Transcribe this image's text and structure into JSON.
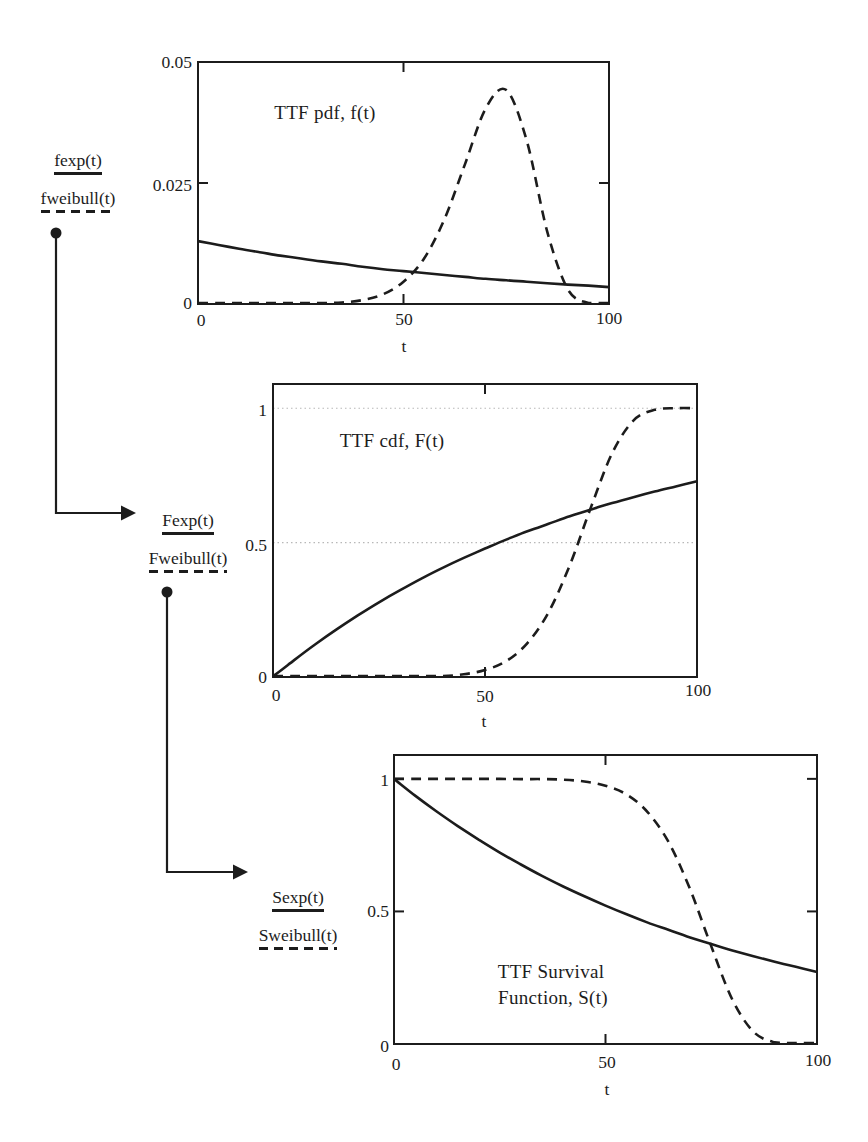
{
  "figure": {
    "background": "#ffffff",
    "ink_color": "#1c1c1c",
    "grid_color": "#b8b8b8"
  },
  "chart_data": [
    {
      "id": "ttf-pdf",
      "type": "line",
      "title": "TTF pdf, f(t)",
      "xlabel": "t",
      "xlim": [
        0,
        100
      ],
      "ylim": [
        0,
        0.05
      ],
      "grid": false,
      "x_tick_labels": [
        "0",
        "50",
        "100"
      ],
      "y_tick_labels": [
        "0",
        "0.025",
        "0.05"
      ],
      "legend": {
        "position": "left",
        "items": [
          {
            "label": "fexp(t)",
            "style": "solid"
          },
          {
            "label": "fweibull(t)",
            "style": "dashed"
          }
        ]
      },
      "x": [
        0,
        5,
        10,
        15,
        20,
        25,
        30,
        35,
        40,
        45,
        50,
        55,
        60,
        65,
        70,
        75,
        80,
        85,
        90,
        95,
        100
      ],
      "series": [
        {
          "name": "fexp(t)",
          "style": "solid",
          "values": [
            0.013,
            0.0122,
            0.0114,
            0.0107,
            0.01,
            0.0094,
            0.0088,
            0.0083,
            0.0077,
            0.0072,
            0.0068,
            0.0064,
            0.006,
            0.0056,
            0.0052,
            0.0049,
            0.0046,
            0.0043,
            0.004,
            0.0038,
            0.0035
          ]
        },
        {
          "name": "fweibull(t)",
          "style": "dashed",
          "values": [
            0,
            0,
            0,
            0,
            0,
            3e-05,
            0.0001,
            0.0003,
            0.0008,
            0.002,
            0.0046,
            0.0094,
            0.0176,
            0.029,
            0.0404,
            0.0442,
            0.0337,
            0.0149,
            0.003,
            0.0002,
            0
          ]
        }
      ]
    },
    {
      "id": "ttf-cdf",
      "type": "line",
      "title": "TTF cdf, F(t)",
      "xlabel": "t",
      "xlim": [
        0,
        100
      ],
      "ylim": [
        0,
        1.09
      ],
      "grid": true,
      "gridlines_at": [
        0.5,
        1
      ],
      "x_tick_labels": [
        "0",
        "50",
        "100"
      ],
      "y_tick_labels": [
        "0",
        "0.5",
        "1"
      ],
      "legend": {
        "position": "left",
        "items": [
          {
            "label": "Fexp(t)",
            "style": "solid"
          },
          {
            "label": "Fweibull(t)",
            "style": "dashed"
          }
        ]
      },
      "x": [
        0,
        5,
        10,
        15,
        20,
        25,
        30,
        35,
        40,
        45,
        50,
        55,
        60,
        65,
        70,
        75,
        80,
        85,
        90,
        95,
        100
      ],
      "series": [
        {
          "name": "Fexp(t)",
          "style": "solid",
          "values": [
            0,
            0.063,
            0.122,
            0.177,
            0.229,
            0.278,
            0.323,
            0.366,
            0.406,
            0.443,
            0.478,
            0.511,
            0.542,
            0.57,
            0.598,
            0.623,
            0.647,
            0.669,
            0.69,
            0.709,
            0.728
          ]
        },
        {
          "name": "Fweibull(t)",
          "style": "dashed",
          "values": [
            0,
            0,
            0,
            0,
            0,
            0,
            0.001,
            0.001,
            0.003,
            0.01,
            0.026,
            0.059,
            0.126,
            0.241,
            0.416,
            0.632,
            0.833,
            0.954,
            0.994,
            1.0,
            1.0
          ]
        }
      ]
    },
    {
      "id": "ttf-survival",
      "type": "line",
      "title": "TTF Survival Function, S(t)",
      "title_lines": [
        "TTF Survival",
        "Function, S(t)"
      ],
      "xlabel": "t",
      "xlim": [
        0,
        100
      ],
      "ylim": [
        0,
        1.09
      ],
      "grid": false,
      "x_tick_labels": [
        "0",
        "50",
        "100"
      ],
      "y_tick_labels": [
        "0",
        "0.5",
        "1"
      ],
      "legend": {
        "position": "left",
        "items": [
          {
            "label": "Sexp(t)",
            "style": "solid"
          },
          {
            "label": "Sweibull(t)",
            "style": "dashed"
          }
        ]
      },
      "x": [
        0,
        5,
        10,
        15,
        20,
        25,
        30,
        35,
        40,
        45,
        50,
        55,
        60,
        65,
        70,
        75,
        80,
        85,
        90,
        95,
        100
      ],
      "series": [
        {
          "name": "Sexp(t)",
          "style": "solid",
          "values": [
            1,
            0.937,
            0.878,
            0.823,
            0.771,
            0.722,
            0.677,
            0.634,
            0.594,
            0.557,
            0.522,
            0.489,
            0.458,
            0.43,
            0.402,
            0.377,
            0.353,
            0.331,
            0.31,
            0.291,
            0.272
          ]
        },
        {
          "name": "Sweibull(t)",
          "style": "dashed",
          "values": [
            1,
            1,
            1,
            1,
            1,
            1,
            0.999,
            0.999,
            0.997,
            0.99,
            0.974,
            0.941,
            0.874,
            0.759,
            0.584,
            0.368,
            0.167,
            0.046,
            0.006,
            0.0002,
            0
          ]
        }
      ]
    }
  ]
}
